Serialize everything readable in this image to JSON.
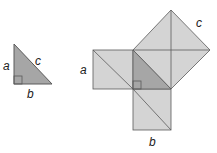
{
  "colors": {
    "square_fill": "#d4d4d4",
    "triangle_fill": "#a6a6a6",
    "stroke": "#5a5a5a"
  },
  "small_triangle": {
    "labels": {
      "a": "a",
      "b": "b",
      "c": "c"
    }
  },
  "large_figure": {
    "labels": {
      "a": "a",
      "b": "b",
      "c": "c"
    }
  }
}
